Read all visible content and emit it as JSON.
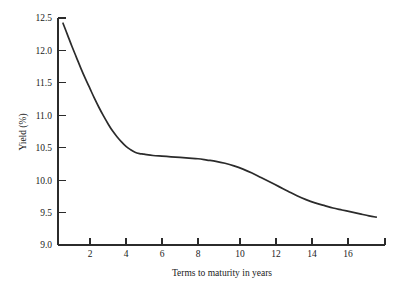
{
  "chart_data": {
    "type": "line",
    "title": "",
    "xlabel": "Terms to maturity in years",
    "ylabel": "Yield (%)",
    "xlim": [
      0,
      18.2
    ],
    "ylim": [
      9.0,
      12.5
    ],
    "grid": false,
    "legend": null,
    "line_color": "#2b2b2b",
    "background_color": "#ffffff",
    "axis_color": "#2b2b2b",
    "xticks": [
      2,
      4,
      6,
      8,
      10,
      12,
      14,
      16
    ],
    "xtick_labels": [
      "2",
      "4",
      "6",
      "8",
      "10",
      "12",
      "14",
      "16"
    ],
    "yticks": [
      9.0,
      9.5,
      10.0,
      10.5,
      11.0,
      11.5,
      12.0,
      12.5
    ],
    "ytick_labels": [
      "9.0",
      "9.5",
      "10.0",
      "10.5",
      "11.0",
      "11.5",
      "12.0",
      "12.5"
    ],
    "series": [
      {
        "name": "Yield curve",
        "x": [
          0.5,
          0.75,
          1.0,
          1.25,
          1.5,
          1.75,
          2.0,
          2.25,
          2.5,
          2.75,
          3.0,
          3.25,
          3.5,
          3.75,
          4.0,
          4.25,
          4.5,
          4.75,
          5.0,
          5.5,
          6.0,
          6.5,
          7.0,
          7.5,
          8.0,
          8.5,
          9.0,
          9.5,
          10.0,
          10.5,
          11.0,
          11.5,
          12.0,
          12.5,
          13.0,
          13.5,
          14.0,
          14.5,
          15.0,
          15.5,
          16.0,
          16.5,
          17.0,
          17.5,
          17.9
        ],
        "y": [
          12.42,
          12.24,
          12.06,
          11.89,
          11.72,
          11.56,
          11.41,
          11.26,
          11.12,
          10.99,
          10.87,
          10.76,
          10.67,
          10.59,
          10.52,
          10.47,
          10.43,
          10.41,
          10.4,
          10.38,
          10.37,
          10.36,
          10.35,
          10.34,
          10.33,
          10.31,
          10.29,
          10.26,
          10.22,
          10.17,
          10.11,
          10.04,
          9.97,
          9.9,
          9.83,
          9.76,
          9.7,
          9.65,
          9.61,
          9.57,
          9.54,
          9.51,
          9.48,
          9.45,
          9.43
        ]
      }
    ]
  },
  "figure": {
    "plot_left_px": 58,
    "plot_right_px": 385,
    "plot_top_px": 18,
    "plot_bottom_px": 245
  }
}
